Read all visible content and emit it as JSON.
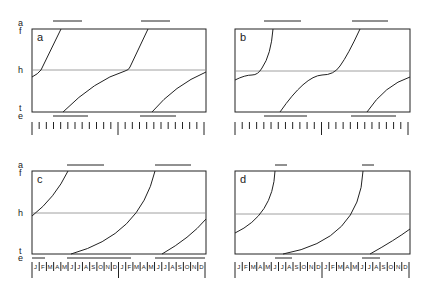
{
  "figure": {
    "axis_labels_left": {
      "top_a": "a",
      "top_f": "f",
      "middle_h": "h",
      "bottom_t": "t",
      "bottom_e": "e"
    },
    "months": [
      "J",
      "F",
      "M",
      "A",
      "M",
      "J",
      "J",
      "A",
      "S",
      "O",
      "N",
      "D",
      "J",
      "F",
      "M",
      "A",
      "M",
      "J",
      "J",
      "A",
      "S",
      "O",
      "N",
      "D"
    ],
    "panels": [
      {
        "id": "a",
        "label": "a",
        "ticks": "unlabeled",
        "curves": "steep-above-h, shallow-below-h, kink at h"
      },
      {
        "id": "b",
        "label": "b",
        "ticks": "unlabeled",
        "curves": "sigmoid with plateau at h"
      },
      {
        "id": "c",
        "label": "c",
        "ticks": "month-labels",
        "curves": "smooth convex"
      },
      {
        "id": "d",
        "label": "d",
        "ticks": "month-labels",
        "curves": "smooth convex, short bars"
      }
    ]
  },
  "chart_data": [
    {
      "type": "line",
      "title": "a",
      "ylabels": [
        "f",
        "h",
        "t"
      ],
      "x_span_months": 24,
      "bars_top": [
        [
          0.12,
          0.29
        ],
        [
          0.63,
          0.79
        ]
      ],
      "bars_bottom": [
        [
          0.12,
          0.32
        ],
        [
          0.62,
          0.83
        ]
      ]
    },
    {
      "type": "line",
      "title": "b",
      "ylabels": [
        "f",
        "h",
        "t"
      ],
      "x_span_months": 24,
      "bars_top": [
        [
          0.17,
          0.38
        ],
        [
          0.67,
          0.87
        ]
      ],
      "bars_bottom": [
        [
          0.17,
          0.41
        ],
        [
          0.66,
          0.92
        ]
      ]
    },
    {
      "type": "line",
      "title": "c",
      "ylabels": [
        "f",
        "h",
        "t"
      ],
      "x_span_months": 24,
      "bars_top": [
        [
          0.2,
          0.41
        ],
        [
          0.71,
          0.91
        ]
      ],
      "bars_bottom": [
        [
          0.0,
          0.08
        ],
        [
          0.2,
          0.57
        ],
        [
          0.71,
          1.0
        ]
      ]
    },
    {
      "type": "line",
      "title": "d",
      "ylabels": [
        "f",
        "h",
        "t"
      ],
      "x_span_months": 24,
      "bars_top": [
        [
          0.23,
          0.3
        ],
        [
          0.73,
          0.8
        ]
      ],
      "bars_bottom": [
        [
          0.23,
          0.33
        ],
        [
          0.73,
          0.83
        ]
      ]
    }
  ]
}
